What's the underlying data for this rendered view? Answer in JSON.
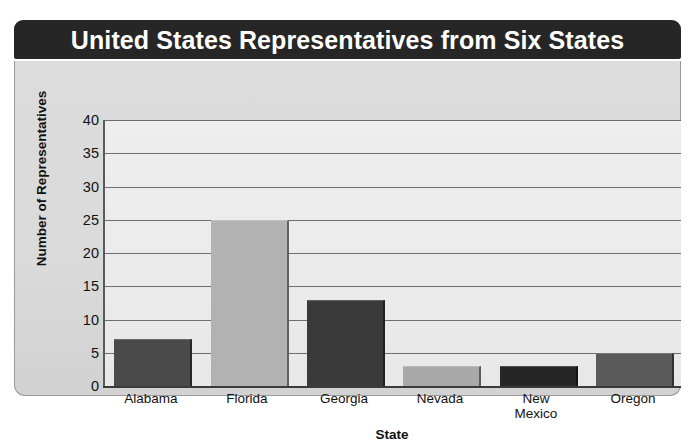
{
  "chart_data": {
    "type": "bar",
    "title": "United States Representatives from Six States",
    "xlabel": "State",
    "ylabel": "Number of Representatives",
    "categories": [
      "Alabama",
      "Florida",
      "Georgia",
      "Nevada",
      "New Mexico",
      "Oregon"
    ],
    "values": [
      7,
      25,
      13,
      3,
      3,
      5
    ],
    "bar_colors": [
      "#4a4a4a",
      "#b2b2b2",
      "#3a3a3a",
      "#a8a8a8",
      "#262626",
      "#5a5a5a"
    ],
    "ylim": [
      0,
      40
    ],
    "yticks": [
      0,
      5,
      10,
      15,
      20,
      25,
      30,
      35,
      40
    ],
    "ytick_labels": [
      "0",
      "5",
      "10",
      "15",
      "20",
      "25",
      "30",
      "35",
      "40"
    ],
    "grid": true,
    "legend": null,
    "title_bar_color": "#262626",
    "title_text_color": "#ffffff",
    "panel_color": "#dcdcdc",
    "plot_color": "#ebebeb",
    "gridline_color": "#6e6e6e",
    "axis_color": "#3a3a3a"
  }
}
